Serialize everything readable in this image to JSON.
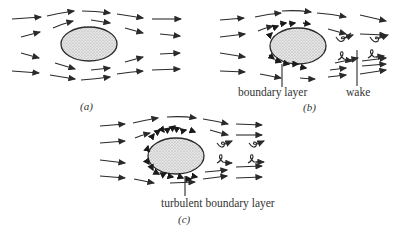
{
  "figure": {
    "panels": [
      {
        "id": "a",
        "caption": "(a)",
        "description": "uniform flow around ellipse",
        "labels": []
      },
      {
        "id": "b",
        "caption": "(b)",
        "description": "laminar boundary layer and wake",
        "labels": [
          {
            "text": "boundary layer"
          },
          {
            "text": "wake"
          }
        ]
      },
      {
        "id": "c",
        "caption": "(c)",
        "description": "turbulent boundary layer and narrower wake",
        "labels": [
          {
            "text": "turbulent boundary layer"
          }
        ]
      }
    ],
    "colors": {
      "ink": "#2a2a2a",
      "fill": "#dcdcdc",
      "background": "#ffffff"
    }
  }
}
